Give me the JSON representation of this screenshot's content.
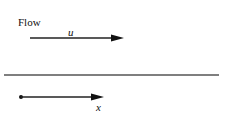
{
  "diagram": {
    "flow_label": "Flow",
    "velocity_label": "u",
    "position_label": "x",
    "colors": {
      "line": "#333333",
      "text": "#111111",
      "background": "#ffffff"
    }
  }
}
